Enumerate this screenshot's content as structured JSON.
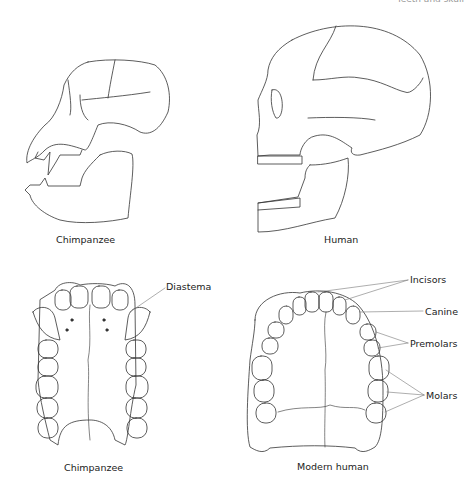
{
  "header": {
    "text": "Teeth and skull"
  },
  "panels": {
    "chimp_skull": {
      "caption": "Chimpanzee"
    },
    "human_skull": {
      "caption": "Human"
    },
    "chimp_palate": {
      "caption": "Chimpanzee",
      "labels": {
        "diastema": "Diastema"
      }
    },
    "human_palate": {
      "caption": "Modern human",
      "labels": {
        "incisors": "Incisors",
        "canine": "Canine",
        "premolars": "Premolars",
        "molars": "Molars"
      }
    }
  },
  "colors": {
    "line": "#333333",
    "leader": "#777777",
    "stipple": "#cccccc"
  }
}
